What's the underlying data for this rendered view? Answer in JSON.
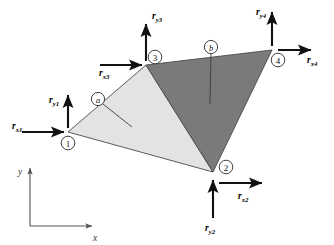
{
  "figure": {
    "background_color": "#ffffff"
  },
  "colors": {
    "element_a_fill": "#e3e3e3",
    "element_b_fill": "#7a7a7a",
    "edge_stroke": "#4a4a4a",
    "force_stroke": "#111111",
    "axis_stroke": "#555555",
    "text": "#000000"
  },
  "nodes": [
    {
      "id": "1",
      "label": "1",
      "x": 68,
      "y": 132,
      "circle_x": 68,
      "circle_y": 143
    },
    {
      "id": "2",
      "label": "2",
      "x": 213,
      "y": 172,
      "circle_x": 226,
      "circle_y": 167
    },
    {
      "id": "3",
      "label": "3",
      "x": 146,
      "y": 65,
      "circle_x": 155,
      "circle_y": 57
    },
    {
      "id": "4",
      "label": "4",
      "x": 272,
      "y": 50,
      "circle_x": 278,
      "circle_y": 60
    }
  ],
  "elements": [
    {
      "id": "a",
      "label": "a",
      "nodes": [
        "1",
        "3",
        "2"
      ],
      "fill": "#e3e3e3",
      "marker_x": 98,
      "marker_y": 99,
      "leader_end_x": 132,
      "leader_end_y": 127
    },
    {
      "id": "b",
      "label": "b",
      "nodes": [
        "3",
        "4",
        "2"
      ],
      "fill": "#7a7a7a",
      "marker_x": 211,
      "marker_y": 47,
      "leader_end_x": 210,
      "leader_end_y": 104
    }
  ],
  "forces": [
    {
      "name": "r_x1",
      "base": "r",
      "subscript": "x1",
      "node": "1",
      "direction": "right",
      "label_x": 12,
      "label_y": 126,
      "arrow_from_x": 22,
      "arrow_from_y": 132,
      "arrow_to_x": 64,
      "arrow_to_y": 132
    },
    {
      "name": "r_y1",
      "base": "r",
      "subscript": "y1",
      "node": "1",
      "direction": "up",
      "label_x": 49,
      "label_y": 100,
      "arrow_from_x": 68,
      "arrow_from_y": 128,
      "arrow_to_x": 68,
      "arrow_to_y": 95
    },
    {
      "name": "r_x2",
      "base": "r",
      "subscript": "x2",
      "node": "2",
      "direction": "right",
      "label_x": 238,
      "label_y": 196,
      "arrow_from_x": 219,
      "arrow_from_y": 183,
      "arrow_to_x": 262,
      "arrow_to_y": 183
    },
    {
      "name": "r_y2",
      "base": "r",
      "subscript": "y2",
      "node": "2",
      "direction": "up",
      "label_x": 205,
      "label_y": 228,
      "arrow_from_x": 213,
      "arrow_from_y": 218,
      "arrow_to_x": 213,
      "arrow_to_y": 180
    },
    {
      "name": "r_x3",
      "base": "r",
      "subscript": "x3",
      "node": "3",
      "direction": "right",
      "label_x": 106,
      "label_y": 73,
      "arrow_from_x": 100,
      "arrow_from_y": 65,
      "arrow_to_x": 142,
      "arrow_to_y": 65
    },
    {
      "name": "r_y3",
      "base": "r",
      "subscript": "y3",
      "node": "3",
      "direction": "up",
      "label_x": 155,
      "label_y": 16,
      "arrow_from_x": 146,
      "arrow_from_y": 61,
      "arrow_to_x": 146,
      "arrow_to_y": 24
    },
    {
      "name": "r_x4",
      "base": "r",
      "subscript": "x4",
      "node": "4",
      "direction": "right",
      "label_x": 313,
      "label_y": 60,
      "arrow_from_x": 278,
      "arrow_from_y": 50,
      "arrow_to_x": 311,
      "arrow_to_y": 50
    },
    {
      "name": "r_y4",
      "base": "r",
      "subscript": "y4",
      "node": "4",
      "direction": "up",
      "label_x": 262,
      "label_y": 12,
      "arrow_from_x": 272,
      "arrow_from_y": 46,
      "arrow_to_x": 272,
      "arrow_to_y": 12
    }
  ],
  "global_axes": {
    "origin_x": 30,
    "origin_y": 226,
    "x_axis": {
      "label": "x",
      "label_x": 95,
      "label_y": 238,
      "arrow_to_x": 92,
      "arrow_to_y": 226
    },
    "y_axis": {
      "label": "y",
      "label_x": 20,
      "label_y": 172,
      "arrow_to_x": 30,
      "arrow_to_y": 168
    }
  }
}
